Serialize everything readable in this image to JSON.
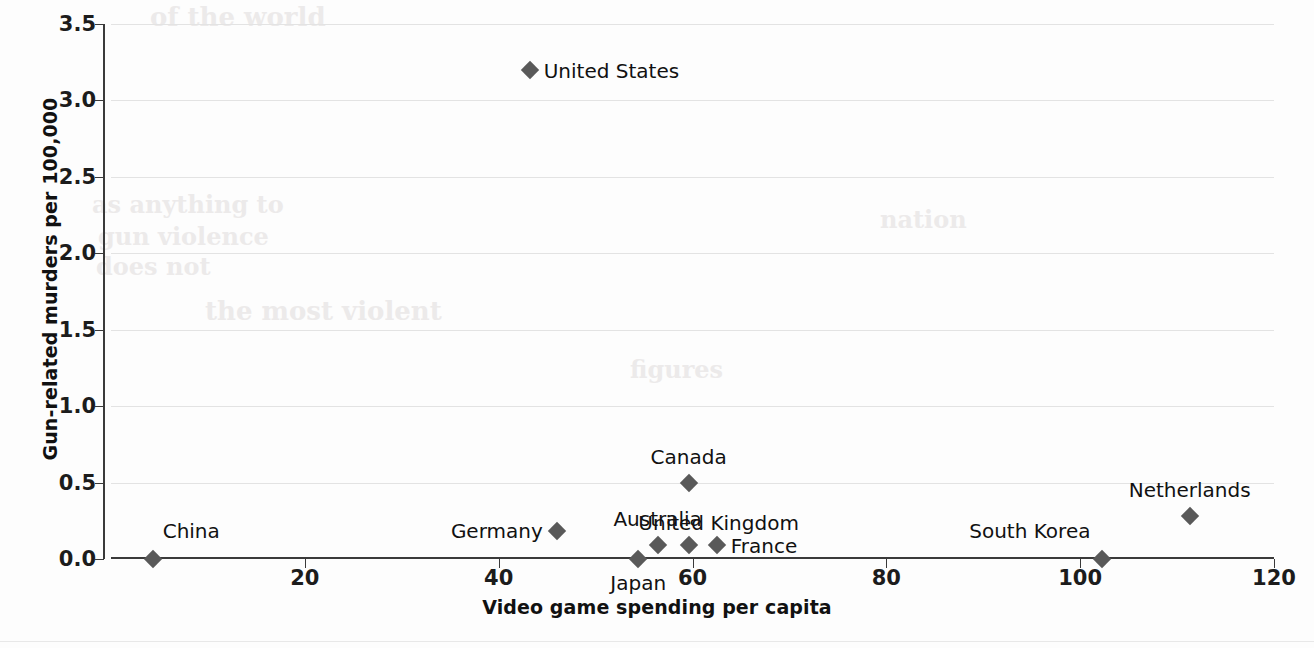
{
  "chart_data": {
    "type": "scatter",
    "title": "",
    "xlabel": "Video game spending per capita",
    "ylabel": "Gun-related murders per 100,000",
    "xlim": [
      0,
      120
    ],
    "ylim": [
      0.0,
      3.5
    ],
    "xticks": [
      "20",
      "40",
      "60",
      "80",
      "100",
      "120"
    ],
    "xtick_values": [
      20,
      40,
      60,
      80,
      100,
      120
    ],
    "yticks": [
      "0.0",
      "0.5",
      "1.0",
      "1.5",
      "2.0",
      "2.5",
      "3.0",
      "3.5"
    ],
    "ytick_values": [
      0.0,
      0.5,
      1.0,
      1.5,
      2.0,
      2.5,
      3.0,
      3.5
    ],
    "grid": "horizontal",
    "legend": "none",
    "marker": "diamond",
    "marker_color": "#595959",
    "points": [
      {
        "label": "China",
        "x": 4.3,
        "y": 0.0,
        "label_pos": "right-up"
      },
      {
        "label": "Japan",
        "x": 54.4,
        "y": 0.0,
        "label_pos": "below"
      },
      {
        "label": "South Korea",
        "x": 102.3,
        "y": 0.0,
        "label_pos": "left-up"
      },
      {
        "label": "Australia",
        "x": 56.4,
        "y": 0.09,
        "label_pos": "above"
      },
      {
        "label": "United Kingdom",
        "x": 59.6,
        "y": 0.09,
        "label_pos": "above-right"
      },
      {
        "label": "France",
        "x": 62.5,
        "y": 0.09,
        "label_pos": "right"
      },
      {
        "label": "Germany",
        "x": 46.0,
        "y": 0.18,
        "label_pos": "left"
      },
      {
        "label": "Netherlands",
        "x": 111.3,
        "y": 0.28,
        "label_pos": "above"
      },
      {
        "label": "Canada",
        "x": 59.6,
        "y": 0.5,
        "label_pos": "above"
      },
      {
        "label": "United States",
        "x": 43.2,
        "y": 3.2,
        "label_pos": "right"
      }
    ]
  },
  "ghost_text": {
    "lines": [
      "of the world",
      "as anything to",
      "gun violence",
      "does not",
      "the most violent",
      "figures",
      "nation"
    ]
  }
}
